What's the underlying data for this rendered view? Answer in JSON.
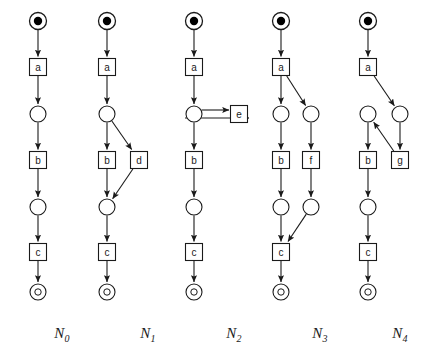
{
  "figure": {
    "background_color": "#ffffff",
    "stroke_color": "#1a1a1a",
    "token_color": "#000000",
    "place_fill": "#ffffff",
    "transition_fill": "#ffffff"
  },
  "geometry": {
    "place_radius": 8,
    "initial_place_radius": 8.5,
    "initial_token_radius": 4.2,
    "final_place_radius": 8,
    "final_inner_radius": 3.2,
    "transition_size": 17,
    "label_font_size": 10
  },
  "nets": [
    {
      "id": "N0",
      "label": "N",
      "subscript": "0",
      "label_x": 62,
      "label_y": 336,
      "column_x": 38,
      "nodes": [
        {
          "name": "p0",
          "kind": "initial-place",
          "label": "",
          "x": 38,
          "y": 21
        },
        {
          "name": "t-a",
          "kind": "transition",
          "label": "a",
          "x": 38,
          "y": 67
        },
        {
          "name": "p1",
          "kind": "place",
          "label": "",
          "x": 38,
          "y": 114
        },
        {
          "name": "t-b",
          "kind": "transition",
          "label": "b",
          "x": 38,
          "y": 160
        },
        {
          "name": "p2",
          "kind": "place",
          "label": "",
          "x": 38,
          "y": 207
        },
        {
          "name": "t-c",
          "kind": "transition",
          "label": "c",
          "x": 38,
          "y": 252
        },
        {
          "name": "p3",
          "kind": "final-place",
          "label": "o",
          "x": 38,
          "y": 292
        }
      ],
      "arcs": [
        {
          "from": "p0",
          "to": "t-a"
        },
        {
          "from": "t-a",
          "to": "p1"
        },
        {
          "from": "p1",
          "to": "t-b"
        },
        {
          "from": "t-b",
          "to": "p2"
        },
        {
          "from": "p2",
          "to": "t-c"
        },
        {
          "from": "t-c",
          "to": "p3"
        }
      ]
    },
    {
      "id": "N1",
      "label": "N",
      "subscript": "1",
      "label_x": 148,
      "label_y": 336,
      "column_x": 107,
      "nodes": [
        {
          "name": "p0",
          "kind": "initial-place",
          "label": "",
          "x": 107,
          "y": 21
        },
        {
          "name": "t-a",
          "kind": "transition",
          "label": "a",
          "x": 107,
          "y": 67
        },
        {
          "name": "p1",
          "kind": "place",
          "label": "",
          "x": 107,
          "y": 114
        },
        {
          "name": "t-b",
          "kind": "transition",
          "label": "b",
          "x": 107,
          "y": 160
        },
        {
          "name": "t-d",
          "kind": "transition",
          "label": "d",
          "x": 139,
          "y": 160
        },
        {
          "name": "p2",
          "kind": "place",
          "label": "",
          "x": 107,
          "y": 207
        },
        {
          "name": "t-c",
          "kind": "transition",
          "label": "c",
          "x": 107,
          "y": 252
        },
        {
          "name": "p3",
          "kind": "final-place",
          "label": "o",
          "x": 107,
          "y": 292
        }
      ],
      "arcs": [
        {
          "from": "p0",
          "to": "t-a"
        },
        {
          "from": "t-a",
          "to": "p1"
        },
        {
          "from": "p1",
          "to": "t-b"
        },
        {
          "from": "p1",
          "to": "t-d"
        },
        {
          "from": "t-b",
          "to": "p2"
        },
        {
          "from": "t-d",
          "to": "p2"
        },
        {
          "from": "p2",
          "to": "t-c"
        },
        {
          "from": "t-c",
          "to": "p3"
        }
      ]
    },
    {
      "id": "N2",
      "label": "N",
      "subscript": "2",
      "label_x": 234,
      "label_y": 336,
      "column_x": 194,
      "nodes": [
        {
          "name": "p0",
          "kind": "initial-place",
          "label": "",
          "x": 194,
          "y": 21
        },
        {
          "name": "t-a",
          "kind": "transition",
          "label": "a",
          "x": 194,
          "y": 67
        },
        {
          "name": "p1",
          "kind": "place",
          "label": "",
          "x": 194,
          "y": 114
        },
        {
          "name": "t-e",
          "kind": "transition",
          "label": "e",
          "x": 239,
          "y": 114
        },
        {
          "name": "t-b",
          "kind": "transition",
          "label": "b",
          "x": 194,
          "y": 160
        },
        {
          "name": "p2",
          "kind": "place",
          "label": "",
          "x": 194,
          "y": 207
        },
        {
          "name": "t-c",
          "kind": "transition",
          "label": "c",
          "x": 194,
          "y": 252
        },
        {
          "name": "p3",
          "kind": "final-place",
          "label": "o",
          "x": 194,
          "y": 292
        }
      ],
      "arcs": [
        {
          "from": "p0",
          "to": "t-a"
        },
        {
          "from": "t-a",
          "to": "p1"
        },
        {
          "from": "p1",
          "to": "t-e",
          "style": "loop-top"
        },
        {
          "from": "t-e",
          "to": "p1",
          "style": "loop-bottom"
        },
        {
          "from": "p1",
          "to": "t-b"
        },
        {
          "from": "t-b",
          "to": "p2"
        },
        {
          "from": "p2",
          "to": "t-c"
        },
        {
          "from": "t-c",
          "to": "p3"
        }
      ]
    },
    {
      "id": "N3",
      "label": "N",
      "subscript": "3",
      "label_x": 320,
      "label_y": 336,
      "column_x": 281,
      "nodes": [
        {
          "name": "p0",
          "kind": "initial-place",
          "label": "",
          "x": 281,
          "y": 21
        },
        {
          "name": "t-a",
          "kind": "transition",
          "label": "a",
          "x": 281,
          "y": 67
        },
        {
          "name": "p1",
          "kind": "place",
          "label": "",
          "x": 281,
          "y": 114
        },
        {
          "name": "p1r",
          "kind": "place",
          "label": "",
          "x": 311,
          "y": 114
        },
        {
          "name": "t-b",
          "kind": "transition",
          "label": "b",
          "x": 281,
          "y": 160
        },
        {
          "name": "t-f",
          "kind": "transition",
          "label": "f",
          "x": 311,
          "y": 160
        },
        {
          "name": "p2",
          "kind": "place",
          "label": "",
          "x": 281,
          "y": 207
        },
        {
          "name": "p2r",
          "kind": "place",
          "label": "",
          "x": 311,
          "y": 207
        },
        {
          "name": "t-c",
          "kind": "transition",
          "label": "c",
          "x": 281,
          "y": 252
        },
        {
          "name": "p3",
          "kind": "final-place",
          "label": "o",
          "x": 281,
          "y": 292
        }
      ],
      "arcs": [
        {
          "from": "p0",
          "to": "t-a"
        },
        {
          "from": "t-a",
          "to": "p1"
        },
        {
          "from": "t-a",
          "to": "p1r"
        },
        {
          "from": "p1",
          "to": "t-b"
        },
        {
          "from": "p1r",
          "to": "t-f"
        },
        {
          "from": "t-b",
          "to": "p2"
        },
        {
          "from": "t-f",
          "to": "p2r"
        },
        {
          "from": "p2",
          "to": "t-c"
        },
        {
          "from": "p2r",
          "to": "t-c"
        },
        {
          "from": "t-c",
          "to": "p3"
        }
      ]
    },
    {
      "id": "N4",
      "label": "N",
      "subscript": "4",
      "label_x": 400,
      "label_y": 336,
      "column_x": 368,
      "nodes": [
        {
          "name": "p0",
          "kind": "initial-place",
          "label": "",
          "x": 368,
          "y": 21
        },
        {
          "name": "t-a",
          "kind": "transition",
          "label": "a",
          "x": 368,
          "y": 67
        },
        {
          "name": "p1",
          "kind": "place",
          "label": "",
          "x": 368,
          "y": 114
        },
        {
          "name": "p1r",
          "kind": "place",
          "label": "",
          "x": 400,
          "y": 114
        },
        {
          "name": "t-b",
          "kind": "transition",
          "label": "b",
          "x": 368,
          "y": 160
        },
        {
          "name": "t-g",
          "kind": "transition",
          "label": "g",
          "x": 400,
          "y": 160
        },
        {
          "name": "p2",
          "kind": "place",
          "label": "",
          "x": 368,
          "y": 207
        },
        {
          "name": "t-c",
          "kind": "transition",
          "label": "c",
          "x": 368,
          "y": 252
        },
        {
          "name": "p3",
          "kind": "final-place",
          "label": "o",
          "x": 368,
          "y": 292
        }
      ],
      "arcs": [
        {
          "from": "p0",
          "to": "t-a"
        },
        {
          "from": "t-a",
          "to": "p1r"
        },
        {
          "from": "p1r",
          "to": "t-g"
        },
        {
          "from": "t-g",
          "to": "p1"
        },
        {
          "from": "p1",
          "to": "t-b"
        },
        {
          "from": "t-b",
          "to": "p2"
        },
        {
          "from": "p2",
          "to": "t-c"
        },
        {
          "from": "t-c",
          "to": "p3"
        }
      ]
    }
  ]
}
